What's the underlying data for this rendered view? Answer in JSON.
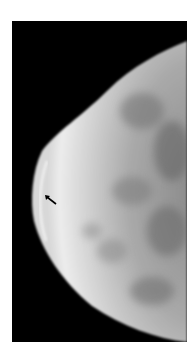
{
  "image": {
    "subject": "mammogram",
    "background_color": "#000000",
    "tissue_color": "#e6e6e6",
    "annotation": {
      "type": "arrow",
      "direction": "up-left",
      "color": "#000000"
    }
  }
}
